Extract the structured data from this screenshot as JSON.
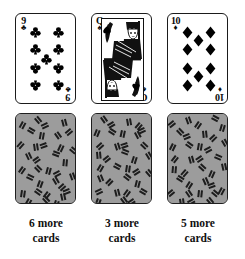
{
  "figure": {
    "background_color": "#ffffff",
    "columns": 3
  },
  "palette": {
    "ink": "#111111",
    "card_face": "#ffffff",
    "card_back": "#9c9c9c",
    "card_back_mark": "#1d1d1d",
    "border": "#1b1b1b"
  },
  "piles": [
    {
      "id": "pile-1",
      "face_card": {
        "rank": "9",
        "suit": "clubs",
        "suit_symbol": "♣",
        "color": "black",
        "pip_count": 9,
        "is_court": false,
        "label": "9 of clubs"
      },
      "back_card": {
        "label": "face-down card",
        "pattern": "scattered dashes"
      },
      "caption": {
        "count": "6",
        "line1": "6 more",
        "line2": "cards",
        "full": "6 more cards"
      }
    },
    {
      "id": "pile-2",
      "face_card": {
        "rank": "Q",
        "suit": "spades",
        "suit_symbol": "♠",
        "color": "black",
        "pip_count": 0,
        "is_court": true,
        "label": "Queen of spades"
      },
      "back_card": {
        "label": "face-down card",
        "pattern": "scattered dashes"
      },
      "caption": {
        "count": "3",
        "line1": "3 more",
        "line2": "cards",
        "full": "3 more cards"
      }
    },
    {
      "id": "pile-3",
      "face_card": {
        "rank": "10",
        "suit": "diamonds",
        "suit_symbol": "♦",
        "color": "black",
        "pip_count": 10,
        "is_court": false,
        "label": "10 of diamonds"
      },
      "back_card": {
        "label": "face-down card",
        "pattern": "scattered dashes"
      },
      "caption": {
        "count": "5",
        "line1": "5 more",
        "line2": "cards",
        "full": "5 more cards"
      }
    }
  ]
}
